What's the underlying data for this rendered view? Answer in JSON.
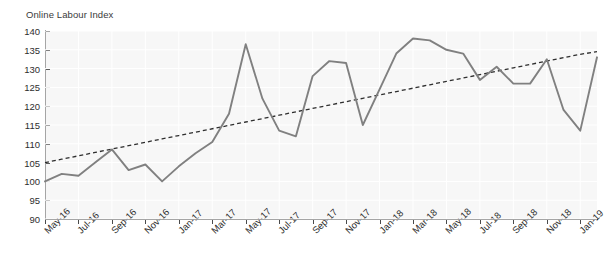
{
  "chart": {
    "title": "Online Labour Index",
    "type": "line"
  },
  "chart_data": {
    "type": "line",
    "title": "Online Labour Index",
    "xlabel": "",
    "ylabel": "",
    "ylim": [
      90,
      140
    ],
    "ytick_step": 5,
    "yticks": [
      90,
      95,
      100,
      105,
      110,
      115,
      120,
      125,
      130,
      135,
      140
    ],
    "grid": true,
    "legend": "none",
    "x": [
      "May-16",
      "Jun-16",
      "Jul-16",
      "Aug-16",
      "Sep-16",
      "Oct-16",
      "Nov-16",
      "Dec-16",
      "Jan-17",
      "Feb-17",
      "Mar-17",
      "Apr-17",
      "May-17",
      "Jun-17",
      "Jul-17",
      "Aug-17",
      "Sep-17",
      "Oct-17",
      "Nov-17",
      "Dec-17",
      "Jan-18",
      "Feb-18",
      "Mar-18",
      "Apr-18",
      "May-18",
      "Jun-18",
      "Jul-18",
      "Aug-18",
      "Sep-18",
      "Oct-18",
      "Nov-18",
      "Dec-18",
      "Jan-19",
      "Feb-19"
    ],
    "xtick_labels": [
      "May-16",
      "Jul-16",
      "Sep-16",
      "Nov-16",
      "Jan-17",
      "Mar-17",
      "May-17",
      "Jul-17",
      "Sep-17",
      "Nov-17",
      "Jan-18",
      "Mar-18",
      "May-18",
      "Jul-18",
      "Sep-18",
      "Nov-18",
      "Jan-19"
    ],
    "series": [
      {
        "name": "Online Labour Index",
        "style": "solid",
        "color": "#808080",
        "values": [
          100,
          102,
          101.5,
          105,
          108.5,
          103,
          104.5,
          100,
          104,
          107.5,
          110.5,
          118,
          136.5,
          122,
          113.5,
          112,
          128,
          132,
          131.5,
          115,
          124.5,
          134,
          138,
          137.5,
          135,
          134,
          127,
          130.5,
          126,
          126,
          132.5,
          119,
          113.5,
          133
        ]
      },
      {
        "name": "Linear trend",
        "style": "dashed",
        "color": "#2e2e2e",
        "values": [
          105,
          105.9,
          106.8,
          107.7,
          108.6,
          109.5,
          110.4,
          111.3,
          112.2,
          113.1,
          114,
          114.9,
          115.8,
          116.7,
          117.6,
          118.5,
          119.4,
          120.3,
          121.2,
          122.1,
          123,
          123.9,
          124.8,
          125.7,
          126.6,
          127.5,
          128.4,
          129.3,
          130.2,
          131.1,
          132,
          132.9,
          133.8,
          134.5
        ]
      }
    ]
  },
  "colors": {
    "plot_background": "#f7f7f7",
    "gridline": "#ffffff",
    "axis": "#4a4a4a",
    "series_line": "#808080",
    "trend_line": "#2e2e2e",
    "text": "#2e2e2e"
  }
}
